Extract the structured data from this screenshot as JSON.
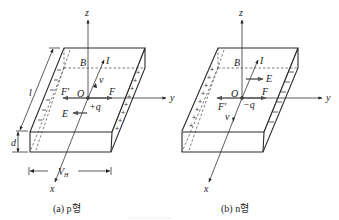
{
  "diagrams": [
    {
      "id": "p-type",
      "caption": "(a) p형",
      "labels": {
        "z": "z",
        "y": "y",
        "x": "x",
        "B": "B",
        "I": "I",
        "v": "v",
        "O": "O",
        "F_prime": "F'",
        "F": "F",
        "q": "+q",
        "E": "E",
        "l": "l",
        "d": "d",
        "V": "V",
        "V_sub": "H"
      },
      "left_face_sign": "−",
      "right_face_sign": "+"
    },
    {
      "id": "n-type",
      "caption": "(b) n형",
      "labels": {
        "z": "z",
        "y": "y",
        "x": "x",
        "B": "B",
        "I": "I",
        "v": "v",
        "O": "O",
        "F_prime": "F'",
        "F": "F",
        "q": "−q",
        "E": "E"
      },
      "left_face_sign": "+",
      "right_face_sign": "−"
    }
  ]
}
